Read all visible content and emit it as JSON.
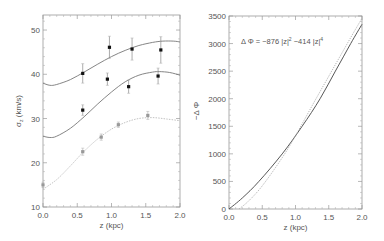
{
  "chart_data": [
    {
      "type": "scatter",
      "panel": "left",
      "title": "",
      "xlabel": "z (kpc)",
      "ylabel": "σz (km/s)",
      "ylabel_main": "σ",
      "ylabel_sub": "z",
      "ylabel_rest": " (km/s)",
      "xlim": [
        0.0,
        2.0
      ],
      "ylim": [
        10,
        53.4
      ],
      "xticks": [
        "0.0",
        "0.5",
        "1.0",
        "1.5",
        "2.0"
      ],
      "yticks": [
        "10",
        "20",
        "30",
        "40",
        "50"
      ],
      "grid": false,
      "series": [
        {
          "name": "upper",
          "color": "#111111",
          "points": [
            {
              "x": 0.58,
              "y": 40.2,
              "err": 2.2
            },
            {
              "x": 0.97,
              "y": 46.1,
              "err": 2.5
            },
            {
              "x": 1.3,
              "y": 45.7,
              "err": 2.5
            },
            {
              "x": 1.72,
              "y": 45.5,
              "err": 3.0
            }
          ],
          "model": {
            "color": "#777777",
            "x": [
              0,
              0.1,
              0.2,
              0.4,
              0.6,
              0.8,
              1.0,
              1.2,
              1.4,
              1.6,
              1.75,
              1.9,
              2.0
            ],
            "y": [
              38.0,
              37.5,
              37.7,
              38.8,
              40.5,
              42.3,
              44.0,
              45.4,
              46.5,
              47.2,
              47.5,
              47.5,
              47.3
            ]
          }
        },
        {
          "name": "middle",
          "color": "#111111",
          "points": [
            {
              "x": 0.58,
              "y": 31.9,
              "err": 1.2
            },
            {
              "x": 0.94,
              "y": 38.9,
              "err": 1.4
            },
            {
              "x": 1.25,
              "y": 37.2,
              "err": 1.5
            },
            {
              "x": 1.68,
              "y": 39.6,
              "err": 1.8
            }
          ],
          "model": {
            "color": "#777777",
            "x": [
              0,
              0.1,
              0.2,
              0.4,
              0.6,
              0.8,
              1.0,
              1.2,
              1.4,
              1.6,
              1.7,
              1.85,
              2.0
            ],
            "y": [
              26.0,
              25.7,
              26.0,
              27.8,
              30.4,
              33.3,
              36.0,
              38.3,
              39.8,
              40.5,
              40.6,
              40.4,
              39.8
            ]
          }
        },
        {
          "name": "lower",
          "color": "#999999",
          "points": [
            {
              "x": 0.0,
              "y": 15.0,
              "err": 0.6
            },
            {
              "x": 0.58,
              "y": 22.5,
              "err": 0.8
            },
            {
              "x": 0.85,
              "y": 25.8,
              "err": 0.7
            },
            {
              "x": 1.1,
              "y": 28.6,
              "err": 0.6
            },
            {
              "x": 1.53,
              "y": 30.7,
              "err": 0.9
            }
          ],
          "model": {
            "color": "#bbbbbb",
            "dashed": true,
            "x": [
              0,
              0.2,
              0.4,
              0.6,
              0.8,
              1.0,
              1.2,
              1.4,
              1.6,
              1.8,
              2.0
            ],
            "y": [
              14.0,
              16.2,
              19.3,
              22.6,
              25.4,
              27.6,
              29.1,
              30.0,
              30.2,
              29.9,
              29.5
            ]
          }
        }
      ]
    },
    {
      "type": "line",
      "panel": "right",
      "title": "",
      "annotation": "Δ Φ = −876 |z|² −414 |z|⁴",
      "annotation_parts": {
        "lhs": "Δ Φ =  −876 |z|",
        "exp1": "2",
        "mid": "  −414 |z|",
        "exp2": "4"
      },
      "xlabel": "z (kpc)",
      "ylabel": "−Δ Φ",
      "xlim": [
        0.0,
        2.0
      ],
      "ylim": [
        0,
        3500
      ],
      "xticks": [
        "0.0",
        "0.5",
        "1.0",
        "1.5",
        "2.0"
      ],
      "yticks": [
        "0",
        "500",
        "1000",
        "1500",
        "2000",
        "2500",
        "3000",
        "3500"
      ],
      "grid": false,
      "series": [
        {
          "name": "solid",
          "color": "#444444",
          "dashed": false,
          "x": [
            0,
            0.2,
            0.45,
            0.8,
            1.1,
            1.37,
            1.6,
            1.83,
            2.0
          ],
          "y": [
            0,
            200,
            500,
            1000,
            1500,
            2000,
            2500,
            3000,
            3350
          ]
        },
        {
          "name": "dotted",
          "color": "#aaaaaa",
          "dashed": true,
          "x": [
            0.15,
            0.3,
            0.5,
            0.8,
            1.0,
            1.3,
            1.6,
            1.85,
            2.0
          ],
          "y": [
            0,
            150,
            420,
            930,
            1330,
            1980,
            2620,
            3150,
            3460
          ]
        }
      ]
    }
  ]
}
